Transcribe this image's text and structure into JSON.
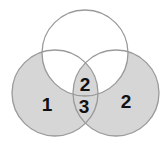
{
  "diagram": {
    "type": "venn",
    "circles": [
      {
        "id": "top",
        "cx": 85,
        "cy": 53,
        "r": 43,
        "fill": "#ffffff",
        "shaded": false
      },
      {
        "id": "left",
        "cx": 55,
        "cy": 93,
        "r": 43,
        "fill": "#d6d6d6",
        "shaded": true
      },
      {
        "id": "right",
        "cx": 116,
        "cy": 93,
        "r": 43,
        "fill": "#d6d6d6",
        "shaded": true
      }
    ],
    "stroke_color": "#9a9a9a",
    "labels": {
      "left_only": "1",
      "center_top": "2",
      "center_bottom": "3",
      "right_only": "2"
    }
  }
}
